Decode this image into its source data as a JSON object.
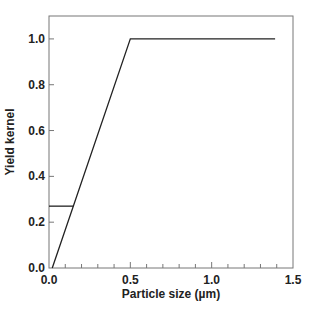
{
  "chart_data": {
    "type": "line",
    "title": "",
    "xlabel": "Particle size (µm)",
    "ylabel": "Yield kernel",
    "xlim": [
      0,
      1.5
    ],
    "ylim": [
      0,
      1.1
    ],
    "x_ticks": [
      0.0,
      0.5,
      1.0,
      1.5
    ],
    "x_tick_labels": [
      "0.0",
      "0.5",
      "1.0",
      "1.5"
    ],
    "x_minor_step": 0.1,
    "y_ticks": [
      0.0,
      0.2,
      0.4,
      0.6,
      0.8,
      1.0
    ],
    "y_tick_labels": [
      "0.0",
      "0.2",
      "0.4",
      "0.6",
      "0.8",
      "1.0"
    ],
    "grid": false,
    "series": [
      {
        "name": "ramp",
        "x": [
          0.02,
          0.5,
          1.39
        ],
        "y": [
          0.0,
          1.0,
          1.0
        ]
      },
      {
        "name": "threshold",
        "x": [
          0.0,
          0.15
        ],
        "y": [
          0.27,
          0.27
        ]
      }
    ]
  }
}
